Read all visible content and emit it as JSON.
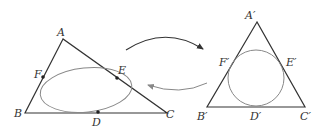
{
  "left_triangle": {
    "vertices": {
      "A": "A",
      "B": "B",
      "C": "C"
    },
    "tangent_points": {
      "D": "D",
      "E": "E",
      "F": "F"
    },
    "inscribed_shape": "ellipse"
  },
  "right_triangle": {
    "vertices": {
      "A": "A′",
      "B": "B′",
      "C": "C′"
    },
    "tangent_points": {
      "D": "D′",
      "E": "E′",
      "F": "F′"
    },
    "inscribed_shape": "circle"
  },
  "arrows": [
    {
      "name": "forward",
      "from": "left",
      "to": "right",
      "color": "#333333"
    },
    {
      "name": "backward",
      "from": "right",
      "to": "left",
      "color": "#888888"
    }
  ],
  "colors": {
    "line": "#333333",
    "curve": "#888888"
  }
}
